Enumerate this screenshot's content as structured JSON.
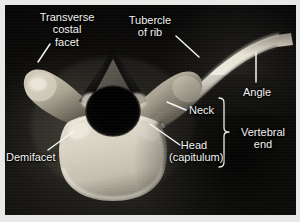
{
  "figure": {
    "kind": "anatomical-photograph",
    "view": "superior view",
    "frame_color": "#e8e8e6",
    "photo_background_color": "#0a0908",
    "label_color": "#f2f2f0",
    "leader_color": "#f4f4f2",
    "bone_light": "#f0ece0",
    "bone_mid": "#b9b3a2",
    "bone_shadow": "#4e4a41"
  },
  "labels": [
    {
      "id": "transverse-costal-facet",
      "lines": [
        "Transverse",
        "costal",
        "facet"
      ],
      "text": "Transverse costal facet",
      "x": 28,
      "y": 11,
      "align": "center",
      "width": 78
    },
    {
      "id": "tubercle-of-rib",
      "lines": [
        "Tubercle",
        "of rib"
      ],
      "text": "Tubercle of rib",
      "x": 120,
      "y": 14,
      "align": "center",
      "width": 60
    },
    {
      "id": "angle",
      "lines": [
        "Angle"
      ],
      "text": "Angle",
      "x": 243,
      "y": 86,
      "align": "left",
      "width": 36
    },
    {
      "id": "neck",
      "lines": [
        "Neck"
      ],
      "text": "Neck",
      "x": 189,
      "y": 104,
      "align": "left",
      "width": 30
    },
    {
      "id": "head-capitulum",
      "lines": [
        "Head",
        "(capitulum)"
      ],
      "text": "Head (capitulum)",
      "x": 169,
      "y": 139,
      "align": "center",
      "width": 50
    },
    {
      "id": "vertebral-end",
      "lines": [
        "Vertebral",
        "end"
      ],
      "text": "Vertebral end",
      "x": 235,
      "y": 126,
      "align": "center",
      "width": 56
    },
    {
      "id": "demifacet",
      "lines": [
        "Demifacet"
      ],
      "text": "Demifacet",
      "x": 6,
      "y": 151,
      "align": "left",
      "width": 60
    }
  ],
  "leaders": [
    {
      "id": "leader-transverse-costal-facet",
      "from": [
        50,
        44
      ],
      "to": [
        38,
        62
      ]
    },
    {
      "id": "leader-tubercle-of-rib",
      "from": [
        176,
        36
      ],
      "to": [
        199,
        57
      ]
    },
    {
      "id": "leader-angle",
      "from": [
        256,
        53
      ],
      "to": [
        256,
        82
      ]
    },
    {
      "id": "leader-neck",
      "from": [
        186,
        110
      ],
      "to": [
        167,
        102
      ]
    },
    {
      "id": "leader-head-capitulum",
      "from": [
        180,
        145
      ],
      "to": [
        150,
        124
      ]
    },
    {
      "id": "leader-demifacet",
      "from": [
        48,
        150
      ],
      "to": [
        74,
        131
      ]
    }
  ],
  "brace": {
    "id": "vertebral-end-brace",
    "x": 224,
    "top": 98,
    "bottom": 167,
    "tip": 132,
    "depth": 6
  }
}
